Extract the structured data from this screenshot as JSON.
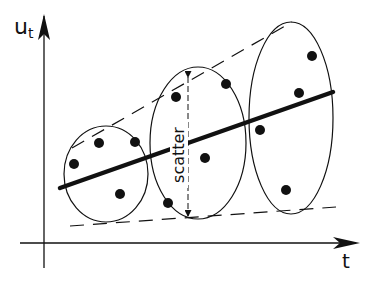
{
  "diagram": {
    "y_axis_label": "u",
    "y_axis_subscript": "t",
    "x_axis_label": "t",
    "scatter_label": "scatter",
    "colors": {
      "ink": "#111111",
      "background": "#ffffff"
    },
    "regression_line": {
      "x1": 60,
      "y1": 188,
      "x2": 333,
      "y2": 92
    },
    "upper_envelope": {
      "x1": 72,
      "y1": 148,
      "x2": 292,
      "y2": 22
    },
    "lower_envelope": {
      "x1": 70,
      "y1": 226,
      "x2": 336,
      "y2": 207
    },
    "groups": [
      {
        "ellipse": {
          "cx": 106,
          "cy": 174,
          "rx": 42,
          "ry": 48
        },
        "points": [
          [
            74,
            164
          ],
          [
            99,
            143
          ],
          [
            135,
            142
          ],
          [
            120,
            194
          ]
        ]
      },
      {
        "ellipse": {
          "cx": 198,
          "cy": 143,
          "rx": 48,
          "ry": 76
        },
        "points": [
          [
            176,
            97
          ],
          [
            226,
            84
          ],
          [
            205,
            158
          ],
          [
            168,
            203
          ]
        ]
      },
      {
        "ellipse": {
          "cx": 291,
          "cy": 118,
          "rx": 42,
          "ry": 96
        },
        "points": [
          [
            312,
            56
          ],
          [
            299,
            93
          ],
          [
            260,
            130
          ],
          [
            286,
            190
          ]
        ]
      }
    ],
    "scatter_arrow": {
      "x": 188,
      "y1": 77,
      "y2": 216
    }
  }
}
